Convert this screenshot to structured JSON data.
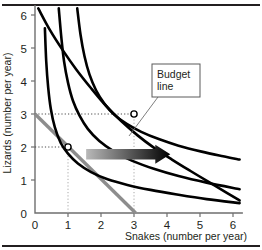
{
  "figure": {
    "title": "",
    "frame": {
      "top_rule": true,
      "bottom_rule": true,
      "rule_color": "#231f20"
    }
  },
  "callout": {
    "name": "budget-line-callout",
    "line1": "Budget",
    "line2": "line",
    "box": {
      "x": 152,
      "y": 64,
      "w": 48,
      "h": 33
    },
    "leader_to": {
      "x": 129,
      "y": 136
    }
  },
  "annotations": {
    "arrow": {
      "name": "shift-arrow",
      "label": "",
      "direction": "right",
      "gradient_from": "#b9b9b9",
      "gradient_to": "#000000",
      "x_start_data": 1.55,
      "x_end_data": 4.1,
      "y_data": 1.78
    },
    "markers": [
      {
        "name": "equilibrium-point-a",
        "x": 1,
        "y": 2
      },
      {
        "name": "equilibrium-point-b",
        "x": 3,
        "y": 3
      }
    ],
    "guides": [
      {
        "name": "guide-y-2",
        "from": [
          0,
          2
        ],
        "to": [
          1,
          2
        ],
        "orientation": "horizontal"
      },
      {
        "name": "guide-x-1",
        "from": [
          1,
          0
        ],
        "to": [
          1,
          2
        ],
        "orientation": "vertical"
      },
      {
        "name": "guide-y-3",
        "from": [
          0,
          3
        ],
        "to": [
          3,
          3
        ],
        "orientation": "horizontal"
      },
      {
        "name": "guide-x-3",
        "from": [
          3,
          0
        ],
        "to": [
          3,
          3
        ],
        "orientation": "vertical"
      }
    ]
  },
  "chart_data": {
    "type": "line",
    "title": "",
    "subtitle": "",
    "xlabel": "Snakes (number per year)",
    "ylabel": "Lizards (number per year)",
    "xlim": [
      0,
      6.3
    ],
    "ylim": [
      0,
      6.3
    ],
    "xticks": [
      0,
      1,
      2,
      3,
      4,
      5,
      6
    ],
    "yticks": [
      0,
      1,
      2,
      3,
      4,
      5,
      6
    ],
    "xticklabels": [
      "0",
      "1",
      "2",
      "3",
      "4",
      "5",
      "6"
    ],
    "yticklabels": [
      "0",
      "1",
      "2",
      "3",
      "4",
      "5",
      "6"
    ],
    "grid": false,
    "legend": "none",
    "series": [
      {
        "name": "indifference-curve-1",
        "kind": "indifference-curve",
        "color": "#000000",
        "points": [
          [
            0.3,
            5.6
          ],
          [
            0.34,
            4.6
          ],
          [
            0.4,
            3.8
          ],
          [
            0.48,
            3.15
          ],
          [
            0.6,
            2.6
          ],
          [
            0.78,
            2.12
          ],
          [
            1.0,
            1.8
          ],
          [
            1.3,
            1.5
          ],
          [
            1.7,
            1.24
          ],
          [
            2.2,
            1.02
          ],
          [
            2.8,
            0.85
          ],
          [
            3.5,
            0.7
          ],
          [
            4.3,
            0.56
          ],
          [
            5.2,
            0.42
          ],
          [
            6.2,
            0.3
          ]
        ]
      },
      {
        "name": "indifference-curve-2",
        "kind": "indifference-curve",
        "color": "#000000",
        "points": [
          [
            0.72,
            6.2
          ],
          [
            0.8,
            5.3
          ],
          [
            0.88,
            4.6
          ],
          [
            1.0,
            3.95
          ],
          [
            1.15,
            3.4
          ],
          [
            1.35,
            2.95
          ],
          [
            1.6,
            2.55
          ],
          [
            1.95,
            2.18
          ],
          [
            2.4,
            1.86
          ],
          [
            2.95,
            1.58
          ],
          [
            3.6,
            1.34
          ],
          [
            4.35,
            1.12
          ],
          [
            5.2,
            0.92
          ],
          [
            6.2,
            0.72
          ]
        ]
      },
      {
        "name": "indifference-curve-3",
        "kind": "indifference-curve",
        "color": "#000000",
        "points": [
          [
            1.28,
            6.2
          ],
          [
            1.38,
            5.4
          ],
          [
            1.5,
            4.75
          ],
          [
            1.65,
            4.2
          ],
          [
            1.85,
            3.72
          ],
          [
            2.1,
            3.32
          ],
          [
            2.4,
            2.98
          ],
          [
            2.78,
            2.7
          ],
          [
            3.22,
            2.46
          ],
          [
            3.75,
            2.24
          ],
          [
            4.35,
            2.04
          ],
          [
            5.05,
            1.86
          ],
          [
            5.7,
            1.72
          ],
          [
            6.2,
            1.62
          ]
        ]
      },
      {
        "name": "indifference-curve-4",
        "kind": "indifference-curve",
        "color": "#000000",
        "points": [
          [
            0.1,
            6.2
          ],
          [
            0.45,
            5.55
          ],
          [
            0.85,
            4.92
          ],
          [
            1.25,
            4.35
          ],
          [
            1.7,
            3.78
          ],
          [
            2.15,
            3.25
          ],
          [
            2.62,
            2.78
          ],
          [
            3.1,
            2.36
          ],
          [
            3.6,
            1.98
          ],
          [
            4.15,
            1.62
          ],
          [
            4.7,
            1.28
          ],
          [
            5.3,
            0.92
          ],
          [
            5.8,
            0.62
          ],
          [
            6.2,
            0.38
          ]
        ]
      }
    ],
    "budget_line": {
      "name": "budget-line",
      "color": "#8d8d8d",
      "from": [
        0,
        3.0
      ],
      "to": [
        3.05,
        0
      ],
      "intercept_lizards": 3.0,
      "intercept_snakes": 3.05
    }
  }
}
